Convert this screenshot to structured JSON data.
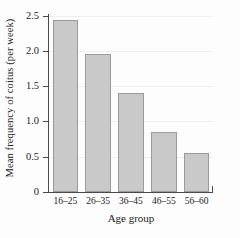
{
  "chart_data": {
    "type": "bar",
    "title": "",
    "subtitle": "",
    "xlabel": "Age group",
    "ylabel": "Mean frequency of coitus (per week)",
    "categories": [
      "16–25",
      "26–35",
      "36–45",
      "46–55",
      "56–60"
    ],
    "values": [
      2.45,
      1.96,
      1.4,
      0.85,
      0.55
    ],
    "ylim": [
      0,
      2.5
    ],
    "ytick_labels": [
      "0",
      "0.5",
      "1.0",
      "1.5",
      "2.0",
      "2.5"
    ],
    "ytick_values": [
      0,
      0.5,
      1.0,
      1.5,
      2.0,
      2.5
    ],
    "grid": true,
    "legend": false,
    "legend_position": "none",
    "bar_fill_color": "#c9c9c9",
    "bar_border_color": "#9a9a9a",
    "axis_color": "#4a4a4a",
    "gridline_color": "#eeeeee",
    "background_color": "#fdfdfd"
  }
}
